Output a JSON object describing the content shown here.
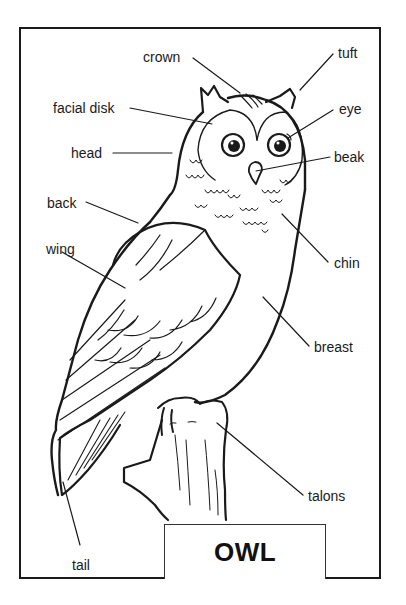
{
  "diagram": {
    "title": "OWL",
    "line_color": "#1a1a1a",
    "background": "#ffffff",
    "labels": [
      {
        "id": "crown",
        "text": "crown",
        "x": 143,
        "y": 49
      },
      {
        "id": "tuft",
        "text": "tuft",
        "x": 338,
        "y": 45
      },
      {
        "id": "facial-disk",
        "text": "facial disk",
        "x": 53,
        "y": 100
      },
      {
        "id": "eye",
        "text": "eye",
        "x": 339,
        "y": 101
      },
      {
        "id": "head",
        "text": "head",
        "x": 71,
        "y": 145
      },
      {
        "id": "beak",
        "text": "beak",
        "x": 334,
        "y": 149
      },
      {
        "id": "back",
        "text": "back",
        "x": 47,
        "y": 195
      },
      {
        "id": "wing",
        "text": "wing",
        "x": 46,
        "y": 241
      },
      {
        "id": "chin",
        "text": "chin",
        "x": 334,
        "y": 255
      },
      {
        "id": "breast",
        "text": "breast",
        "x": 314,
        "y": 339
      },
      {
        "id": "talons",
        "text": "talons",
        "x": 308,
        "y": 488
      },
      {
        "id": "tail",
        "text": "tail",
        "x": 72,
        "y": 557
      }
    ]
  }
}
